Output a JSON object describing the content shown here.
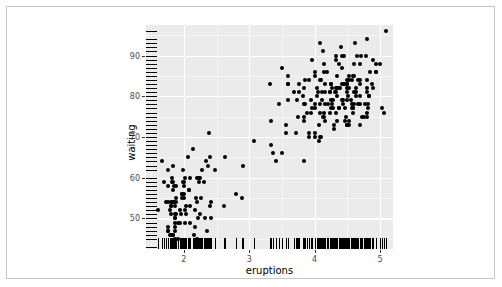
{
  "figure": {
    "background_color": "#ffffff",
    "frame_color": "#c8c8c8",
    "panel_color": "#ebebeb",
    "gridline_color": "#ffffff",
    "point_color": "#000000",
    "axis_text_color": "#4d4d4d"
  },
  "chart_data": {
    "type": "scatter",
    "title": "",
    "xlabel": "eruptions",
    "ylabel": "waiting",
    "xlim": [
      1.42,
      5.2
    ],
    "ylim": [
      42.5,
      97.5
    ],
    "grid": true,
    "legend": null,
    "x_ticks": [
      2,
      3,
      4,
      5
    ],
    "x_tick_labels": [
      "2",
      "3",
      "4",
      "5"
    ],
    "y_ticks": [
      50,
      60,
      70,
      80,
      90
    ],
    "y_tick_labels": [
      "50",
      "60",
      "70",
      "80",
      "90"
    ],
    "x_minor_ticks": [
      1.5,
      2.5,
      3.5,
      4.5
    ],
    "y_minor_ticks": [
      45,
      55,
      65,
      75,
      85,
      95
    ],
    "rug_x": true,
    "rug_y": true,
    "marker": "filled-circle",
    "marker_size_px": 4,
    "n_points": 272,
    "series_name": "faithful",
    "points": [
      [
        3.6,
        79
      ],
      [
        1.8,
        54
      ],
      [
        3.333,
        74
      ],
      [
        2.283,
        62
      ],
      [
        4.533,
        85
      ],
      [
        2.883,
        55
      ],
      [
        4.7,
        88
      ],
      [
        3.6,
        85
      ],
      [
        1.95,
        51
      ],
      [
        4.35,
        85
      ],
      [
        1.833,
        54
      ],
      [
        3.917,
        84
      ],
      [
        4.2,
        78
      ],
      [
        1.75,
        47
      ],
      [
        4.7,
        83
      ],
      [
        2.167,
        52
      ],
      [
        1.75,
        62
      ],
      [
        4.8,
        84
      ],
      [
        1.6,
        52
      ],
      [
        4.25,
        79
      ],
      [
        1.8,
        51
      ],
      [
        1.75,
        47
      ],
      [
        3.45,
        78
      ],
      [
        3.067,
        69
      ],
      [
        4.533,
        74
      ],
      [
        3.6,
        83
      ],
      [
        1.967,
        55
      ],
      [
        4.083,
        76
      ],
      [
        3.85,
        78
      ],
      [
        4.433,
        79
      ],
      [
        4.3,
        73
      ],
      [
        4.467,
        77
      ],
      [
        3.367,
        66
      ],
      [
        4.033,
        80
      ],
      [
        3.833,
        74
      ],
      [
        2.017,
        52
      ],
      [
        1.867,
        48
      ],
      [
        4.833,
        80
      ],
      [
        1.833,
        59
      ],
      [
        4.783,
        90
      ],
      [
        4.35,
        80
      ],
      [
        1.883,
        58
      ],
      [
        4.567,
        84
      ],
      [
        1.75,
        58
      ],
      [
        4.533,
        73
      ],
      [
        3.317,
        83
      ],
      [
        3.833,
        64
      ],
      [
        2.1,
        53
      ],
      [
        4.633,
        82
      ],
      [
        2,
        59
      ],
      [
        4.8,
        75
      ],
      [
        4.716,
        90
      ],
      [
        1.833,
        54
      ],
      [
        4.833,
        80
      ],
      [
        1.733,
        54
      ],
      [
        4.883,
        83
      ],
      [
        3.717,
        71
      ],
      [
        1.667,
        64
      ],
      [
        4.567,
        77
      ],
      [
        4.317,
        81
      ],
      [
        2.233,
        59
      ],
      [
        4.5,
        84
      ],
      [
        1.75,
        48
      ],
      [
        4.8,
        82
      ],
      [
        1.817,
        60
      ],
      [
        4.4,
        92
      ],
      [
        4.167,
        78
      ],
      [
        4.7,
        78
      ],
      [
        2.067,
        65
      ],
      [
        4.7,
        73
      ],
      [
        4.033,
        82
      ],
      [
        1.967,
        56
      ],
      [
        4.5,
        79
      ],
      [
        4,
        71
      ],
      [
        1.983,
        62
      ],
      [
        5.067,
        76
      ],
      [
        2.017,
        60
      ],
      [
        4.567,
        78
      ],
      [
        3.883,
        76
      ],
      [
        3.6,
        83
      ],
      [
        4.133,
        75
      ],
      [
        4.333,
        82
      ],
      [
        4.1,
        70
      ],
      [
        2.633,
        65
      ],
      [
        4.067,
        73
      ],
      [
        4.933,
        88
      ],
      [
        3.95,
        76
      ],
      [
        4.517,
        80
      ],
      [
        2.167,
        48
      ],
      [
        4,
        86
      ],
      [
        2.2,
        60
      ],
      [
        4.333,
        90
      ],
      [
        1.867,
        50
      ],
      [
        4.817,
        78
      ],
      [
        1.833,
        63
      ],
      [
        4.3,
        72
      ],
      [
        4.667,
        84
      ],
      [
        3.75,
        75
      ],
      [
        1.867,
        51
      ],
      [
        4.9,
        82
      ],
      [
        2.483,
        62
      ],
      [
        4.367,
        88
      ],
      [
        2.1,
        49
      ],
      [
        4.5,
        83
      ],
      [
        4.05,
        81
      ],
      [
        1.867,
        47
      ],
      [
        4.7,
        84
      ],
      [
        1.783,
        52
      ],
      [
        4.85,
        86
      ],
      [
        3.683,
        81
      ],
      [
        4.733,
        75
      ],
      [
        2.3,
        59
      ],
      [
        4.9,
        89
      ],
      [
        4.417,
        79
      ],
      [
        1.7,
        59
      ],
      [
        4.633,
        81
      ],
      [
        2.317,
        50
      ],
      [
        4.6,
        85
      ],
      [
        1.817,
        59
      ],
      [
        4.417,
        87
      ],
      [
        2.617,
        53
      ],
      [
        4.067,
        69
      ],
      [
        4.25,
        77
      ],
      [
        1.967,
        56
      ],
      [
        4.6,
        88
      ],
      [
        3.767,
        81
      ],
      [
        1.917,
        45
      ],
      [
        4.5,
        82
      ],
      [
        2.267,
        55
      ],
      [
        4.65,
        90
      ],
      [
        1.867,
        45
      ],
      [
        4.167,
        83
      ],
      [
        2.8,
        56
      ],
      [
        4.333,
        89
      ],
      [
        1.833,
        46
      ],
      [
        4.383,
        82
      ],
      [
        1.883,
        51
      ],
      [
        4.933,
        86
      ],
      [
        2.033,
        53
      ],
      [
        3.733,
        79
      ],
      [
        4.233,
        81
      ],
      [
        2.233,
        60
      ],
      [
        4.533,
        82
      ],
      [
        4.817,
        77
      ],
      [
        4.333,
        76
      ],
      [
        1.983,
        59
      ],
      [
        4.633,
        80
      ],
      [
        2.017,
        49
      ],
      [
        5.1,
        96
      ],
      [
        1.8,
        53
      ],
      [
        5.033,
        77
      ],
      [
        4,
        77
      ],
      [
        2.4,
        65
      ],
      [
        4.6,
        81
      ],
      [
        3.567,
        71
      ],
      [
        4,
        70
      ],
      [
        4.5,
        81
      ],
      [
        4.083,
        93
      ],
      [
        1.8,
        53
      ],
      [
        3.967,
        89
      ],
      [
        2.2,
        45
      ],
      [
        4.15,
        86
      ],
      [
        2,
        58
      ],
      [
        3.833,
        78
      ],
      [
        3.5,
        66
      ],
      [
        4.583,
        76
      ],
      [
        2.367,
        63
      ],
      [
        5,
        88
      ],
      [
        1.933,
        52
      ],
      [
        4.617,
        93
      ],
      [
        1.917,
        49
      ],
      [
        2.083,
        57
      ],
      [
        4.583,
        77
      ],
      [
        3.333,
        68
      ],
      [
        4.167,
        81
      ],
      [
        4.333,
        81
      ],
      [
        4.5,
        73
      ],
      [
        2.417,
        50
      ],
      [
        4,
        85
      ],
      [
        4.167,
        74
      ],
      [
        1.883,
        55
      ],
      [
        4.583,
        77
      ],
      [
        4.25,
        83
      ],
      [
        3.767,
        83
      ],
      [
        2.033,
        51
      ],
      [
        4.433,
        78
      ],
      [
        4.083,
        84
      ],
      [
        1.833,
        46
      ],
      [
        4.417,
        83
      ],
      [
        2.183,
        55
      ],
      [
        4.8,
        81
      ],
      [
        1.833,
        57
      ],
      [
        4.8,
        76
      ],
      [
        4.1,
        84
      ],
      [
        3.966,
        77
      ],
      [
        4.233,
        81
      ],
      [
        3.5,
        87
      ],
      [
        4.366,
        77
      ],
      [
        2.25,
        51
      ],
      [
        4.667,
        78
      ],
      [
        2.1,
        60
      ],
      [
        4.35,
        82
      ],
      [
        4.133,
        91
      ],
      [
        1.867,
        53
      ],
      [
        4.6,
        78
      ],
      [
        1.783,
        46
      ],
      [
        4.367,
        77
      ],
      [
        3.85,
        84
      ],
      [
        1.933,
        49
      ],
      [
        4.5,
        83
      ],
      [
        2.383,
        71
      ],
      [
        4.7,
        80
      ],
      [
        1.867,
        49
      ],
      [
        3.833,
        75
      ],
      [
        3.417,
        64
      ],
      [
        4.233,
        76
      ],
      [
        2.4,
        53
      ],
      [
        4.8,
        94
      ],
      [
        2,
        55
      ],
      [
        4.15,
        76
      ],
      [
        1.867,
        50
      ],
      [
        4.267,
        82
      ],
      [
        1.75,
        54
      ],
      [
        4.483,
        75
      ],
      [
        4,
        78
      ],
      [
        4.117,
        79
      ],
      [
        4.083,
        78
      ],
      [
        4.267,
        78
      ],
      [
        3.917,
        70
      ],
      [
        4.55,
        79
      ],
      [
        4.083,
        70
      ],
      [
        2.417,
        54
      ],
      [
        4.183,
        86
      ],
      [
        2.217,
        50
      ],
      [
        4.45,
        90
      ],
      [
        1.883,
        54
      ],
      [
        1.85,
        54
      ],
      [
        4.283,
        77
      ],
      [
        3.95,
        79
      ],
      [
        2.333,
        64
      ],
      [
        4.15,
        75
      ],
      [
        2.35,
        47
      ],
      [
        4.933,
        86
      ],
      [
        2.9,
        63
      ],
      [
        4.583,
        85
      ],
      [
        3.833,
        82
      ],
      [
        2.083,
        57
      ],
      [
        4.367,
        82
      ],
      [
        2.133,
        67
      ],
      [
        4.35,
        74
      ],
      [
        2.2,
        54
      ],
      [
        4.45,
        83
      ],
      [
        3.567,
        73
      ],
      [
        4.5,
        73
      ],
      [
        4.15,
        88
      ],
      [
        3.817,
        80
      ],
      [
        3.917,
        71
      ],
      [
        4.45,
        83
      ],
      [
        2,
        56
      ],
      [
        4.283,
        79
      ],
      [
        4.767,
        78
      ],
      [
        4.533,
        84
      ],
      [
        1.85,
        58
      ],
      [
        4.25,
        83
      ],
      [
        1.983,
        43
      ],
      [
        2.25,
        60
      ],
      [
        4.75,
        75
      ],
      [
        4.117,
        81
      ],
      [
        2.15,
        46
      ],
      [
        4.417,
        90
      ],
      [
        1.817,
        46
      ],
      [
        4.467,
        74
      ]
    ]
  }
}
